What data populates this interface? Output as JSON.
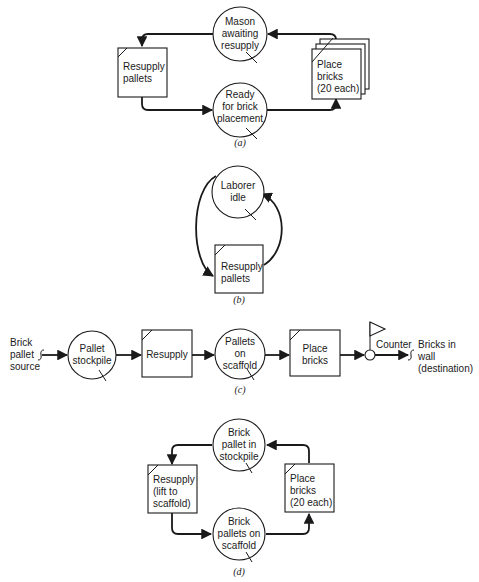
{
  "figure": {
    "panels": [
      {
        "id": "a",
        "caption": "(a)",
        "nodes": {
          "mason_awaiting": {
            "type": "queue",
            "lines": [
              "Mason",
              "awaiting",
              "resupply"
            ]
          },
          "ready_for_placement": {
            "type": "queue",
            "lines": [
              "Ready",
              "for brick",
              "placement"
            ]
          },
          "resupply_pallets": {
            "type": "activity",
            "lines": [
              "Resupply",
              "pallets"
            ]
          },
          "place_bricks": {
            "type": "activity-stacked",
            "lines": [
              "Place",
              "bricks",
              "(20 each)"
            ]
          }
        }
      },
      {
        "id": "b",
        "caption": "(b)",
        "nodes": {
          "laborer_idle": {
            "type": "queue",
            "lines": [
              "Laborer",
              "idle"
            ]
          },
          "resupply_pallets": {
            "type": "activity",
            "lines": [
              "Resupply",
              "pallets"
            ]
          }
        }
      },
      {
        "id": "c",
        "caption": "(c)",
        "nodes": {
          "source": {
            "type": "source",
            "lines": [
              "Brick",
              "pallet",
              "source"
            ]
          },
          "pallet_stockpile": {
            "type": "queue",
            "lines": [
              "Pallet",
              "stockpile"
            ]
          },
          "resupply": {
            "type": "activity",
            "lines": [
              "Resupply"
            ]
          },
          "pallets_on_scaffold": {
            "type": "queue",
            "lines": [
              "Pallets",
              "on",
              "scaffold"
            ]
          },
          "place_bricks": {
            "type": "activity",
            "lines": [
              "Place",
              "bricks"
            ]
          },
          "counter": {
            "type": "counter",
            "lines": [
              "Counter"
            ]
          },
          "destination": {
            "type": "sink",
            "lines": [
              "Bricks in",
              "wall",
              "(destination)"
            ]
          }
        }
      },
      {
        "id": "d",
        "caption": "(d)",
        "nodes": {
          "brick_pallet_stockpile": {
            "type": "queue",
            "lines": [
              "Brick",
              "pallet in",
              "stockpile"
            ]
          },
          "resupply_lift": {
            "type": "activity",
            "lines": [
              "Resupply",
              "(lift to",
              "scaffold)"
            ]
          },
          "brick_pallets_on_scaffold": {
            "type": "queue",
            "lines": [
              "Brick",
              "pallets on",
              "scaffold"
            ]
          },
          "place_bricks": {
            "type": "activity",
            "lines": [
              "Place",
              "bricks",
              "(20 each)"
            ]
          }
        }
      }
    ]
  }
}
